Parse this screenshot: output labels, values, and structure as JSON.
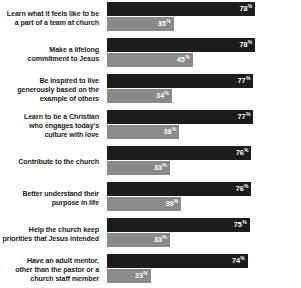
{
  "chart_data": {
    "type": "bar",
    "orientation": "horizontal",
    "title": "",
    "subtitle": "",
    "xlabel": "",
    "ylabel": "",
    "xlim": [
      0,
      100
    ],
    "grid": false,
    "legend_position": "none",
    "value_suffix": "%",
    "colors": {
      "series_1": "#1c1c1c",
      "series_2": "#8a8a8a",
      "label_text": "#1a1a1a",
      "value_text": "#ffffff",
      "background": "#ffffff"
    },
    "categories": [
      "Learn what it feels like to be a part of a team at church",
      "Make a lifelong commitment to Jesus",
      "Be inspired to live generously based on the example of others",
      "Learn to be a Christian who engages today's culture with love",
      "Contribute to the church",
      "Better understand their purpose in life",
      "Help the church keep priorities that Jesus intended",
      "Have an adult mentor, other than the pastor or a church staff member"
    ],
    "series": [
      {
        "name": "series_1",
        "values": [
          78,
          78,
          77,
          77,
          76,
          76,
          75,
          74
        ]
      },
      {
        "name": "series_2",
        "values": [
          35,
          45,
          34,
          38,
          33,
          39,
          33,
          23
        ]
      }
    ],
    "rows": [
      {
        "label_lines": [
          "Learn what it feels like to be",
          "a part of a team at church"
        ],
        "primary": "78",
        "secondary": "35",
        "suffix": "%"
      },
      {
        "label_lines": [
          "Make a lifelong",
          "commitment to Jesus"
        ],
        "primary": "78",
        "secondary": "45",
        "suffix": "%"
      },
      {
        "label_lines": [
          "Be inspired to live",
          "generously based on the",
          "example of others"
        ],
        "primary": "77",
        "secondary": "34",
        "suffix": "%"
      },
      {
        "label_lines": [
          "Learn to be a Christian",
          "who engages today's",
          "culture with love"
        ],
        "primary": "77",
        "secondary": "38",
        "suffix": "%"
      },
      {
        "label_lines": [
          "Contribute to the church"
        ],
        "primary": "76",
        "secondary": "33",
        "suffix": "%"
      },
      {
        "label_lines": [
          "Better understand their",
          "purpose in life"
        ],
        "primary": "76",
        "secondary": "39",
        "suffix": "%"
      },
      {
        "label_lines": [
          "Help the church keep",
          "priorities that Jesus intended"
        ],
        "primary": "75",
        "secondary": "33",
        "suffix": "%"
      },
      {
        "label_lines": [
          "Have an adult mentor,",
          "other than the pastor or a",
          "church staff member"
        ],
        "primary": "74",
        "secondary": "23",
        "suffix": "%"
      }
    ]
  }
}
